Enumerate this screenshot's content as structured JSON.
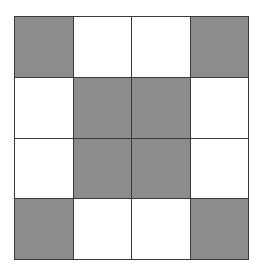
{
  "diagram": {
    "type": "grid",
    "rows": 4,
    "cols": 4,
    "colors": {
      "shaded": "#8c8c8c",
      "empty": "#ffffff",
      "line": "#3a3a3a"
    },
    "cells": [
      [
        1,
        0,
        0,
        1
      ],
      [
        0,
        1,
        1,
        0
      ],
      [
        0,
        1,
        1,
        0
      ],
      [
        1,
        0,
        0,
        1
      ]
    ]
  }
}
